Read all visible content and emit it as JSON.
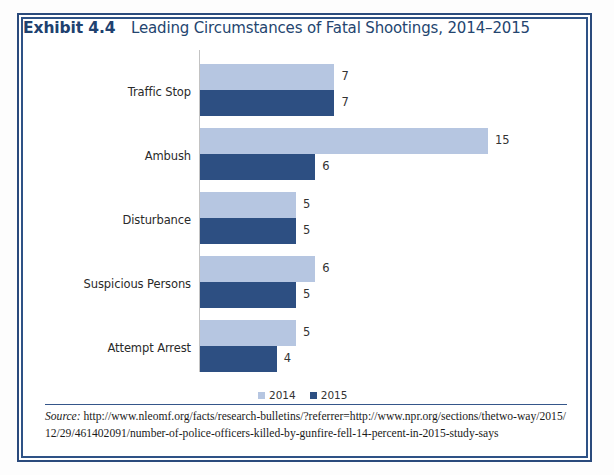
{
  "exhibit": {
    "label": "Exhibit 4.4",
    "title": "Leading Circumstances of Fatal Shootings, 2014–2015"
  },
  "legend": {
    "items": [
      {
        "label": "2014",
        "color": "#b6c6e1"
      },
      {
        "label": "2015",
        "color": "#2d4f82"
      }
    ]
  },
  "source": {
    "word": "Source:",
    "line1": " http://www.nleomf.org/facts/research-bulletins/?referrer=http://www.npr.org/sections/thetwo-way/2015/",
    "line2": "12/29/461402091/number-of-police-officers-killed-by-gunfire-fell-14-percent-in-2015-study-says"
  },
  "chart_data": {
    "type": "bar",
    "orientation": "horizontal",
    "title": "Leading Circumstances of Fatal Shootings, 2014–2015",
    "xlabel": "",
    "ylabel": "",
    "grid": false,
    "legend_position": "bottom",
    "xlim": [
      0,
      16
    ],
    "categories": [
      "Traffic Stop",
      "Ambush",
      "Disturbance",
      "Suspicious Persons",
      "Attempt Arrest"
    ],
    "series": [
      {
        "name": "2014",
        "color": "#b6c6e1",
        "values": [
          7,
          15,
          5,
          6,
          5
        ]
      },
      {
        "name": "2015",
        "color": "#2d4f82",
        "values": [
          7,
          6,
          5,
          5,
          4
        ]
      }
    ],
    "value_labels": {
      "Traffic Stop": {
        "2014": "7",
        "2015": "7"
      },
      "Ambush": {
        "2014": "15",
        "2015": "6"
      },
      "Disturbance": {
        "2014": "5",
        "2015": "5"
      },
      "Suspicious Persons": {
        "2014": "6",
        "2015": "5"
      },
      "Attempt Arrest": {
        "2014": "5",
        "2015": "4"
      }
    }
  }
}
